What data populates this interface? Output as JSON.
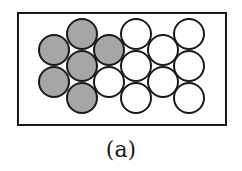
{
  "caption": "(a)",
  "colors": {
    "filled": "#a6a6a6",
    "empty": "#ffffff",
    "stroke": "#1a1a1a"
  },
  "frame": {
    "x": 18,
    "y": 13,
    "width": 208,
    "height": 112
  },
  "radius": 15,
  "circles": [
    {
      "cx": 54,
      "cy": 50,
      "filled": true
    },
    {
      "cx": 54,
      "cy": 82,
      "filled": true
    },
    {
      "cx": 82,
      "cy": 34,
      "filled": true
    },
    {
      "cx": 82,
      "cy": 66,
      "filled": true
    },
    {
      "cx": 82,
      "cy": 98,
      "filled": true
    },
    {
      "cx": 109,
      "cy": 50,
      "filled": true
    },
    {
      "cx": 109,
      "cy": 82,
      "filled": false
    },
    {
      "cx": 136,
      "cy": 34,
      "filled": false
    },
    {
      "cx": 136,
      "cy": 66,
      "filled": false
    },
    {
      "cx": 136,
      "cy": 98,
      "filled": false
    },
    {
      "cx": 163,
      "cy": 50,
      "filled": false
    },
    {
      "cx": 163,
      "cy": 82,
      "filled": false
    },
    {
      "cx": 189,
      "cy": 34,
      "filled": false
    },
    {
      "cx": 189,
      "cy": 66,
      "filled": false
    },
    {
      "cx": 189,
      "cy": 98,
      "filled": false
    }
  ]
}
